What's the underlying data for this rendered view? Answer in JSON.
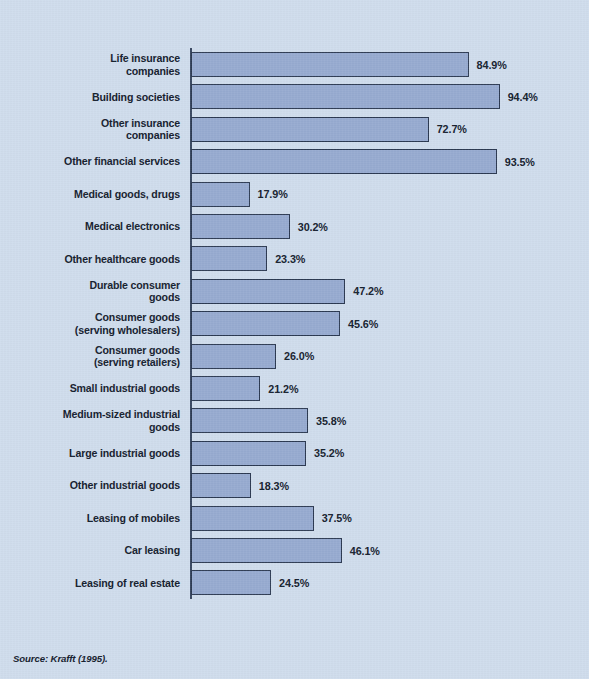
{
  "figure": {
    "source_note": "Source: Krafft (1995).",
    "background_color": "#cfdded",
    "bar_fill_color": "#97abd0",
    "bar_border_color": "#2c3a52",
    "axis_color": "#3b4a63",
    "text_color": "#15202e"
  },
  "chart_data": {
    "type": "bar",
    "orientation": "horizontal",
    "title": "",
    "subtitle": "",
    "xlabel": "",
    "ylabel": "",
    "xlim": [
      0,
      100
    ],
    "grid": false,
    "legend": null,
    "value_suffix": "%",
    "categories": [
      "Life insurance companies",
      "Building societies",
      "Other insurance companies",
      "Other financial services",
      "Medical goods, drugs",
      "Medical electronics",
      "Other healthcare goods",
      "Durable consumer goods",
      "Consumer goods (serving wholesalers)",
      "Consumer goods (serving retailers)",
      "Small industrial goods",
      "Medium-sized industrial goods",
      "Large industrial goods",
      "Other industrial goods",
      "Leasing of mobiles",
      "Car leasing",
      "Leasing of real estate"
    ],
    "values": [
      84.9,
      94.4,
      72.7,
      93.5,
      17.9,
      30.2,
      23.3,
      47.2,
      45.6,
      26.0,
      21.2,
      35.8,
      35.2,
      18.3,
      37.5,
      46.1,
      24.5
    ],
    "bars": [
      {
        "label_lines": [
          "Life insurance",
          "companies"
        ],
        "value": 84.9,
        "value_label": "84.9%"
      },
      {
        "label_lines": [
          "Building societies"
        ],
        "value": 94.4,
        "value_label": "94.4%"
      },
      {
        "label_lines": [
          "Other insurance",
          "companies"
        ],
        "value": 72.7,
        "value_label": "72.7%"
      },
      {
        "label_lines": [
          "Other financial services"
        ],
        "value": 93.5,
        "value_label": "93.5%"
      },
      {
        "label_lines": [
          "Medical goods, drugs"
        ],
        "value": 17.9,
        "value_label": "17.9%"
      },
      {
        "label_lines": [
          "Medical electronics"
        ],
        "value": 30.2,
        "value_label": "30.2%"
      },
      {
        "label_lines": [
          "Other healthcare goods"
        ],
        "value": 23.3,
        "value_label": "23.3%"
      },
      {
        "label_lines": [
          "Durable consumer",
          "goods"
        ],
        "value": 47.2,
        "value_label": "47.2%"
      },
      {
        "label_lines": [
          "Consumer goods",
          "(serving wholesalers)"
        ],
        "value": 45.6,
        "value_label": "45.6%"
      },
      {
        "label_lines": [
          "Consumer goods",
          "(serving retailers)"
        ],
        "value": 26.0,
        "value_label": "26.0%"
      },
      {
        "label_lines": [
          "Small industrial goods"
        ],
        "value": 21.2,
        "value_label": "21.2%"
      },
      {
        "label_lines": [
          "Medium-sized industrial",
          "goods"
        ],
        "value": 35.8,
        "value_label": "35.8%"
      },
      {
        "label_lines": [
          "Large industrial goods"
        ],
        "value": 35.2,
        "value_label": "35.2%"
      },
      {
        "label_lines": [
          "Other industrial goods"
        ],
        "value": 18.3,
        "value_label": "18.3%"
      },
      {
        "label_lines": [
          "Leasing of mobiles"
        ],
        "value": 37.5,
        "value_label": "37.5%"
      },
      {
        "label_lines": [
          "Car leasing"
        ],
        "value": 46.1,
        "value_label": "46.1%"
      },
      {
        "label_lines": [
          "Leasing of real estate"
        ],
        "value": 24.5,
        "value_label": "24.5%"
      }
    ]
  },
  "layout": {
    "row_top_start": 48,
    "row_pitch": 32.4,
    "px_per_unit": 3.27,
    "bar_origin_x": 191
  }
}
